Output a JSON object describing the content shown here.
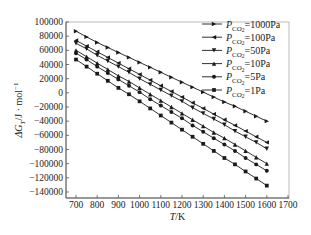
{
  "chart_data": {
    "type": "line",
    "title": "",
    "xlabel": "T/K",
    "ylabel": "ΔG_T/J · mol^-1",
    "xlim": [
      700,
      1700
    ],
    "ylim": [
      -140000,
      100000
    ],
    "xticks": [
      700,
      800,
      900,
      1000,
      1100,
      1200,
      1300,
      1400,
      1500,
      1600,
      1700
    ],
    "yticks": [
      100000,
      80000,
      60000,
      40000,
      20000,
      0,
      -20000,
      -40000,
      -60000,
      -80000,
      -100000,
      -120000,
      -140000
    ],
    "grid": false,
    "legend_position": "upper right",
    "x": [
      700,
      750,
      800,
      850,
      900,
      950,
      1000,
      1050,
      1100,
      1150,
      1200,
      1250,
      1300,
      1350,
      1400,
      1450,
      1500,
      1550,
      1600
    ],
    "series": [
      {
        "name": "P_CO2=1000Pa",
        "marker": "triangle-right",
        "values": [
          87000,
          79000,
          71000,
          64000,
          57000,
          50000,
          43000,
          36000,
          29000,
          22000,
          15000,
          8000,
          1000,
          -6000,
          -13000,
          -19000,
          -26000,
          -33000,
          -40000
        ]
      },
      {
        "name": "P_CO2=100Pa",
        "marker": "triangle-left",
        "values": [
          74000,
          66000,
          58000,
          50000,
          42000,
          34000,
          26000,
          18000,
          10000,
          2000,
          -6000,
          -14000,
          -22000,
          -30000,
          -38000,
          -46000,
          -54000,
          -62000,
          -70000
        ]
      },
      {
        "name": "P_CO2=50Pa",
        "marker": "triangle-down",
        "values": [
          70000,
          62000,
          53000,
          45000,
          37000,
          29000,
          20000,
          12000,
          4000,
          -4000,
          -12000,
          -21000,
          -29000,
          -37000,
          -45000,
          -54000,
          -62000,
          -70000,
          -79000
        ]
      },
      {
        "name": "P_CO2=10Pa",
        "marker": "triangle-up",
        "values": [
          60000,
          51000,
          42000,
          33000,
          24000,
          16000,
          7000,
          -2000,
          -11000,
          -20000,
          -29000,
          -38000,
          -47000,
          -56000,
          -64000,
          -73000,
          -82000,
          -91000,
          -100000
        ]
      },
      {
        "name": "P_CO2=5Pa",
        "marker": "circle",
        "values": [
          56000,
          47000,
          37000,
          28000,
          19000,
          10000,
          1000,
          -9000,
          -18000,
          -27000,
          -36000,
          -46000,
          -55000,
          -64000,
          -73000,
          -82000,
          -92000,
          -101000,
          -110000
        ]
      },
      {
        "name": "P_CO2=1Pa",
        "marker": "square",
        "values": [
          47000,
          37000,
          27000,
          17000,
          7000,
          -2000,
          -12000,
          -22000,
          -32000,
          -42000,
          -52000,
          -62000,
          -72000,
          -82000,
          -92000,
          -101000,
          -111000,
          -121000,
          -131000
        ]
      }
    ]
  },
  "legend": [
    {
      "prefix": "P",
      "sub": "CO",
      "subsub": "2",
      "suffix": "=1000Pa"
    },
    {
      "prefix": "P",
      "sub": "CO",
      "subsub": "2",
      "suffix": "=100Pa"
    },
    {
      "prefix": "P",
      "sub": "CO",
      "subsub": "2",
      "suffix": "=50Pa"
    },
    {
      "prefix": "P",
      "sub": "CO",
      "subsub": "2",
      "suffix": "=10Pa"
    },
    {
      "prefix": "P",
      "sub": "CO",
      "subsub": "2",
      "suffix": "=5Pa"
    },
    {
      "prefix": "P",
      "sub": "CO",
      "subsub": "2",
      "suffix": "=1Pa"
    }
  ],
  "axis_labels": {
    "x_italic": "T",
    "x_unit": "/K",
    "y_delta": "ΔG",
    "y_sub": "T",
    "y_unit": "/J · mol",
    "y_sup": "−1"
  },
  "colors": {
    "line": "#1a1a1a",
    "axis": "#555555",
    "text": "#222222"
  }
}
